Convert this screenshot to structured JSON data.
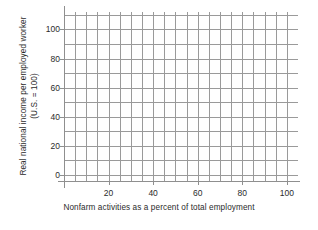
{
  "chart_data": {
    "type": "line",
    "title": "",
    "subtitle": "",
    "xlabel": "Nonfarm activities as a percent of total employment",
    "ylabel": "Real national income per employed worker",
    "ylabel_line2": "(U.S. = 100)",
    "xlim": [
      0,
      105
    ],
    "ylim": [
      -5,
      112
    ],
    "x_ticks": [
      20,
      40,
      60,
      80,
      100
    ],
    "x_tick_labels": [
      "20",
      "40",
      "60",
      "80",
      "100"
    ],
    "y_ticks": [
      0,
      20,
      40,
      60,
      80,
      100
    ],
    "y_tick_labels": [
      "0",
      "20",
      "40",
      "60",
      "80",
      "100"
    ],
    "x_gridlines": [
      0,
      5,
      10,
      15,
      20,
      25,
      30,
      35,
      40,
      45,
      50,
      55,
      60,
      65,
      70,
      75,
      80,
      85,
      90,
      95,
      100
    ],
    "y_gridlines": [
      0,
      10,
      20,
      30,
      40,
      50,
      60,
      70,
      80,
      90,
      100,
      110
    ],
    "grid": true,
    "legend": false,
    "legend_position": "none",
    "series": [],
    "annotations": []
  },
  "style": {
    "grid_color": "#9a9a9a",
    "axis_color": "#8f8f8f",
    "text_color": "#2b2b2b",
    "background": "#ffffff"
  }
}
